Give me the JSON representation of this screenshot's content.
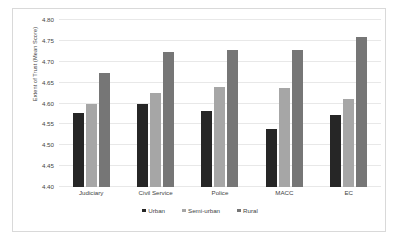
{
  "chart_data": {
    "type": "bar",
    "title": "",
    "xlabel": "",
    "ylabel": "Extent of Trust (Mean Score)",
    "ylim": [
      4.4,
      4.8
    ],
    "yticks": [
      "4.40",
      "4.45",
      "4.50",
      "4.55",
      "4.60",
      "4.65",
      "4.70",
      "4.75",
      "4.80"
    ],
    "ytick_values": [
      4.4,
      4.45,
      4.5,
      4.55,
      4.6,
      4.65,
      4.7,
      4.75,
      4.8
    ],
    "grid": true,
    "legend_position": "bottom",
    "categories": [
      "Judiciary",
      "Civil Service",
      "Police",
      "MACC",
      "EC"
    ],
    "series": [
      {
        "name": "Urban",
        "color": "#262626",
        "values": [
          4.578,
          4.6,
          4.581,
          4.538,
          4.573
        ]
      },
      {
        "name": "Semi-urban",
        "color": "#a6a6a6",
        "values": [
          4.6,
          4.624,
          4.639,
          4.637,
          4.612
        ]
      },
      {
        "name": "Rural",
        "color": "#767676",
        "values": [
          4.672,
          4.723,
          4.729,
          4.728,
          4.759
        ]
      }
    ]
  }
}
